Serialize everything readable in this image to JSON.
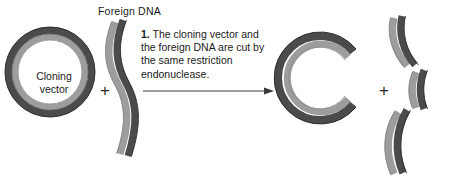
{
  "diagram": {
    "width": 454,
    "height": 183
  },
  "labels": {
    "foreign_dna": "Foreign DNA",
    "cloning_vector_line1": "Cloning",
    "cloning_vector_line2": "vector",
    "plus_left": "+",
    "plus_right": "+"
  },
  "step": {
    "number": "1.",
    "text": "The cloning vector and the foreign DNA are cut by the same restriction endonuclease."
  },
  "icons": {
    "arrow": "arrow-right-icon",
    "plus": "plus-icon"
  },
  "colors": {
    "strand_dark": "#4b4b4b",
    "strand_light": "#9d9d9d",
    "strand_outline": "#2e2e2e",
    "text": "#1a1a1a",
    "background": "#ffffff",
    "arrow": "#3a3a3a"
  },
  "shapes": {
    "cloning_vector": {
      "kind": "closed-circular-plasmid",
      "outer_ring_color": "#4b4b4b",
      "inner_ring_color": "#9d9d9d"
    },
    "foreign_dna": {
      "kind": "s-curved-double-strand",
      "left_band_color": "#9d9d9d",
      "right_band_color": "#4b4b4b"
    },
    "cut_vector": {
      "kind": "open-c-shaped-plasmid",
      "gap_side": "right",
      "outer_ring_color": "#4b4b4b",
      "inner_ring_color": "#9d9d9d"
    },
    "fragments": {
      "kind": "three-curved-dna-fragments",
      "count": 3,
      "light_band_color": "#9d9d9d",
      "dark_band_color": "#4b4b4b"
    }
  }
}
